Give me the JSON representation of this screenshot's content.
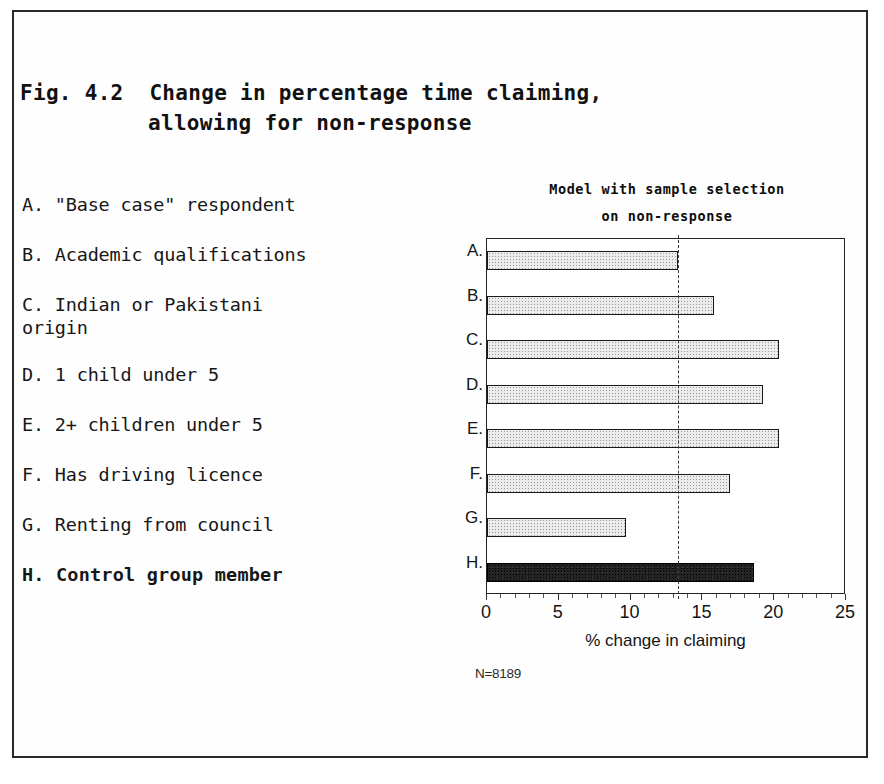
{
  "figure": {
    "caption_line1": "Fig. 4.2  Change in percentage time claiming,",
    "caption_line2": "allowing for non-response"
  },
  "legend": {
    "items": [
      {
        "key": "A.",
        "label": "A. \"Base case\" respondent",
        "emphasis": false
      },
      {
        "key": "B.",
        "label": "B. Academic qualifications",
        "emphasis": false
      },
      {
        "key": "C.",
        "label": "C. Indian or Pakistani\norigin",
        "emphasis": false
      },
      {
        "key": "D.",
        "label": "D. 1 child under 5",
        "emphasis": false
      },
      {
        "key": "E.",
        "label": "E. 2+ children under 5",
        "emphasis": false
      },
      {
        "key": "F.",
        "label": "F. Has driving licence",
        "emphasis": false
      },
      {
        "key": "G.",
        "label": "G. Renting from council",
        "emphasis": false
      },
      {
        "key": "H.",
        "label": "H. Control group member",
        "emphasis": true
      }
    ]
  },
  "chart_data": {
    "type": "bar",
    "orientation": "horizontal",
    "title": "Model with sample selection on non-response",
    "title_line1": "Model with sample selection",
    "title_line2": "on non-response",
    "categories": [
      "A.",
      "B.",
      "C.",
      "D.",
      "E.",
      "F.",
      "G.",
      "H."
    ],
    "category_descriptions": [
      "\"Base case\" respondent",
      "Academic qualifications",
      "Indian or Pakistani origin",
      "1 child under 5",
      "2+ children under 5",
      "Has driving licence",
      "Renting from council",
      "Control group member"
    ],
    "values": [
      13.3,
      15.8,
      20.3,
      19.2,
      20.3,
      16.9,
      9.7,
      18.6
    ],
    "xlabel": "% change in claiming",
    "ylabel": "",
    "xlim": [
      0,
      25
    ],
    "xticks": [
      0,
      5,
      10,
      15,
      20,
      25
    ],
    "xtick_labels": [
      "0",
      "5",
      "10",
      "15",
      "20",
      "25"
    ],
    "grid": false,
    "reference_line": 13.3,
    "highlight_index": 7,
    "bar_fill": "#ececec",
    "bar_highlight_fill": "#232323",
    "bar_border": "#1a1a1a",
    "annotation": "N=8189"
  }
}
